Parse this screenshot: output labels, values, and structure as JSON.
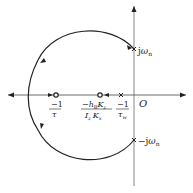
{
  "diagram": {
    "type": "root-locus",
    "axes": {
      "origin_label": "O",
      "real_axis": {
        "direction": "both",
        "arrows": true
      },
      "imag_axis": {
        "direction": "up",
        "arrows": true
      }
    },
    "poles": [
      {
        "id": "pole-jwn",
        "label_prefix": "j",
        "label_sym": "ω",
        "label_sub": "n"
      },
      {
        "id": "pole-neg-jwn",
        "label_prefix": "−j",
        "label_sym": "ω",
        "label_sub": "n"
      },
      {
        "id": "pole-tw",
        "label_num": "−1",
        "label_den_sym": "τ",
        "label_den_sub": "w"
      }
    ],
    "zeros": [
      {
        "id": "zero-tau",
        "label_num": "−1",
        "label_den_sym": "τ"
      },
      {
        "id": "zero-hb",
        "label_num_prefix": "−h",
        "label_num_sub": "B",
        "label_num_k": "K",
        "label_num_ksub": "z",
        "label_den_i": "I",
        "label_den_isub": "z",
        "label_den_k": "K",
        "label_den_ksub": "x"
      }
    ],
    "colors": {
      "stroke": "#222222",
      "axis": "#555555",
      "background": "#ffffff"
    }
  }
}
